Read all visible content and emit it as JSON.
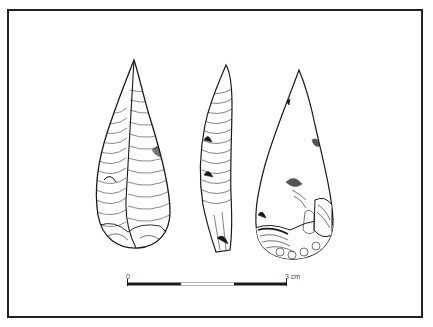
{
  "figure": {
    "views": [
      {
        "id": "face",
        "label": "Flaked face"
      },
      {
        "id": "profile",
        "label": "Side profile"
      },
      {
        "id": "reverse",
        "label": "Reverse face with cortex"
      }
    ]
  },
  "scale_bar": {
    "start_label": "0",
    "end_label": "3 cm",
    "segments": 3
  },
  "colors": {
    "ink": "#1a1a1a",
    "frame": "#222222",
    "background": "#ffffff"
  }
}
